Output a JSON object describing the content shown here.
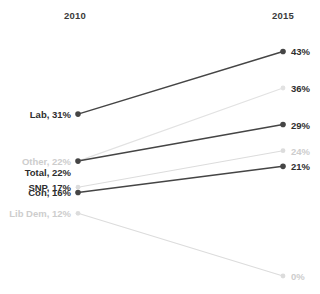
{
  "chart_data": {
    "type": "line",
    "title": "",
    "subtitle": "",
    "xlabel": "",
    "ylabel": "",
    "grid": false,
    "legend_position": "inline-endpoint-labels",
    "x": [
      "2010",
      "2015"
    ],
    "axis_headers": {
      "left": "2010",
      "right": "2015"
    },
    "ylim": [
      0,
      45
    ],
    "series": [
      {
        "name": "Lab",
        "values": [
          31,
          43
        ],
        "left_label": "Lab, 31%",
        "right_label": "43%",
        "emphasis": "dark",
        "color": "#454545"
      },
      {
        "name": "Other",
        "values": [
          22,
          36
        ],
        "left_label": "Other, 22%",
        "right_label": "36%",
        "emphasis": "muted-line-dark-right-label",
        "color": "#e2e2e2"
      },
      {
        "name": "Total",
        "values": [
          22,
          29
        ],
        "left_label": "Total, 22%",
        "right_label": "29%",
        "emphasis": "dark",
        "color": "#454545"
      },
      {
        "name": "SNP",
        "values": [
          17,
          24
        ],
        "left_label": "SNP, 17%",
        "right_label": "24%",
        "emphasis": "muted",
        "color": "#dcdcdc"
      },
      {
        "name": "Con",
        "values": [
          16,
          21
        ],
        "left_label": "Con, 16%",
        "right_label": "21%",
        "emphasis": "dark",
        "color": "#454545"
      },
      {
        "name": "Lib Dem",
        "values": [
          12,
          0
        ],
        "left_label": "Lib Dem, 12%",
        "right_label": "0%",
        "emphasis": "muted",
        "color": "#dcdcdc"
      }
    ]
  },
  "colors": {
    "dark_line": "#454545",
    "muted_line": "#dcdcdc",
    "dark_text": "#2e2e2e",
    "muted_text": "#cdcdcd",
    "background": "#ffffff"
  }
}
